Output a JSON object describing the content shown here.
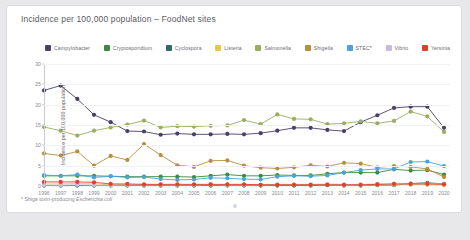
{
  "card": {
    "title": "Incidence per 100,000 population – FoodNet sites",
    "footnote_marker": "*",
    "footnote_prefix": " Shiga toxin-producing ",
    "footnote_italic": "Escherichia coli"
  },
  "chart_data": {
    "type": "line",
    "title": "Incidence per 100,000 population – FoodNet sites",
    "xlabel": "",
    "ylabel": "Incidence per 100,000 population",
    "ylim": [
      0,
      30
    ],
    "yticks": [
      0,
      5,
      10,
      15,
      20,
      25,
      30
    ],
    "grid": true,
    "legend_position": "top",
    "categories": [
      "1996",
      "1997",
      "1998",
      "1999",
      "2000",
      "2001",
      "2002",
      "2003",
      "2004",
      "2005",
      "2006",
      "2007",
      "2008",
      "2009",
      "2010",
      "2011",
      "2012",
      "2013",
      "2014",
      "2015",
      "2016",
      "2017",
      "2018",
      "2019",
      "2020"
    ],
    "series": [
      {
        "name": "Campylobacter",
        "color": "#4b3f6b",
        "values": [
          23.5,
          24.7,
          21.4,
          17.5,
          15.7,
          13.5,
          13.4,
          12.6,
          12.9,
          12.7,
          12.7,
          12.8,
          12.7,
          13.0,
          13.6,
          14.3,
          14.3,
          13.8,
          13.5,
          15.7,
          17.4,
          19.2,
          19.5,
          19.5,
          14.3
        ]
      },
      {
        "name": "Cryptosporidium",
        "color": "#3c8a3c",
        "values": [
          2.5,
          2.5,
          2.5,
          2.5,
          2.4,
          2.3,
          2.3,
          2.3,
          2.3,
          2.2,
          2.5,
          2.8,
          2.5,
          2.5,
          2.7,
          2.6,
          2.6,
          3.0,
          3.3,
          3.3,
          3.3,
          4.1,
          3.8,
          3.9,
          2.8
        ]
      },
      {
        "name": "Cyclospora",
        "color": "#2f6b5e",
        "values": [
          0.1,
          0.1,
          0.1,
          0.1,
          0.1,
          0.1,
          0.1,
          0.1,
          0.1,
          0.1,
          0.1,
          0.1,
          0.1,
          0.1,
          0.1,
          0.1,
          0.1,
          0.2,
          0.1,
          0.1,
          0.2,
          0.2,
          0.6,
          0.8,
          0.5
        ]
      },
      {
        "name": "Listeria",
        "color": "#e3c84a",
        "values": [
          0.5,
          0.5,
          0.6,
          0.5,
          0.3,
          0.3,
          0.3,
          0.3,
          0.3,
          0.3,
          0.3,
          0.3,
          0.3,
          0.3,
          0.3,
          0.3,
          0.3,
          0.3,
          0.2,
          0.2,
          0.3,
          0.3,
          0.3,
          0.3,
          0.2
        ]
      },
      {
        "name": "Salmonella",
        "color": "#9aae62",
        "values": [
          14.5,
          13.6,
          12.4,
          13.6,
          14.4,
          15.1,
          16.1,
          14.4,
          14.7,
          14.6,
          14.8,
          14.9,
          16.2,
          15.2,
          17.6,
          16.5,
          16.4,
          15.2,
          15.4,
          15.9,
          15.4,
          16.0,
          18.3,
          17.1,
          13.3
        ]
      },
      {
        "name": "Shigella",
        "color": "#b5903f",
        "values": [
          8.0,
          7.5,
          8.5,
          5.0,
          7.4,
          6.4,
          10.3,
          7.6,
          5.1,
          4.7,
          6.2,
          6.3,
          5.0,
          4.5,
          4.3,
          4.6,
          5.1,
          4.8,
          5.7,
          5.5,
          4.6,
          4.9,
          4.7,
          4.2,
          2.2
        ]
      },
      {
        "name": "STEC*",
        "color": "#4aa3dd",
        "values": [
          2.7,
          2.5,
          2.8,
          2.1,
          2.4,
          2.1,
          2.2,
          1.7,
          1.5,
          1.6,
          2.0,
          1.9,
          1.7,
          1.6,
          2.3,
          2.5,
          2.4,
          2.6,
          3.3,
          3.9,
          4.2,
          4.2,
          5.9,
          6.0,
          4.9
        ]
      },
      {
        "name": "Vibrio",
        "color": "#c9bcd8",
        "values": [
          0.2,
          0.2,
          0.3,
          0.2,
          0.2,
          0.3,
          0.3,
          0.3,
          0.3,
          0.3,
          0.4,
          0.3,
          0.3,
          0.3,
          0.4,
          0.4,
          0.4,
          0.5,
          0.4,
          0.4,
          0.5,
          0.5,
          0.5,
          0.6,
          0.5
        ]
      },
      {
        "name": "Yersinia",
        "color": "#e0402a",
        "values": [
          1.0,
          1.0,
          1.0,
          0.9,
          0.5,
          0.5,
          0.4,
          0.4,
          0.4,
          0.4,
          0.4,
          0.4,
          0.4,
          0.3,
          0.3,
          0.3,
          0.3,
          0.3,
          0.3,
          0.3,
          0.4,
          0.5,
          0.5,
          0.5,
          0.4
        ]
      }
    ]
  }
}
